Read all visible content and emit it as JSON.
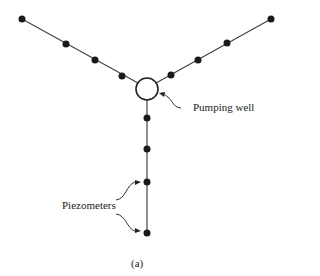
{
  "labels": {
    "pumping_well": "Pumping well",
    "piezometers": "Piezometers",
    "caption": "(a)"
  },
  "colors": {
    "line": "#444444",
    "node": "#1a1a1a",
    "text": "#222222"
  }
}
